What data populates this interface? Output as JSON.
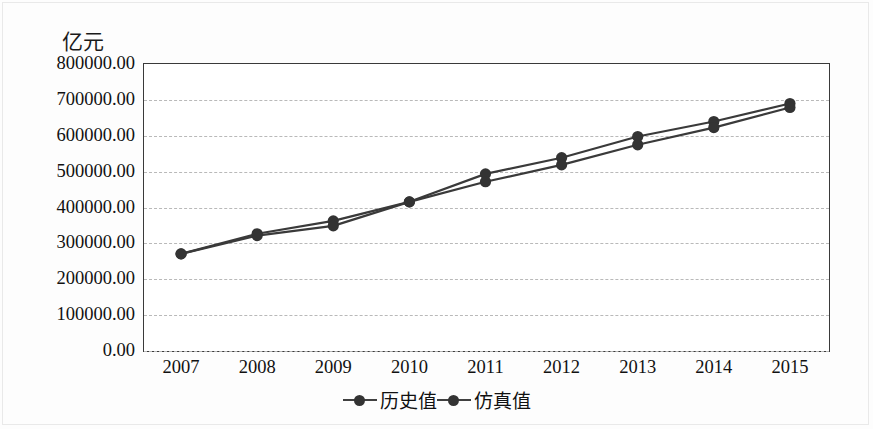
{
  "chart_data": {
    "type": "line",
    "title": "",
    "subtitle": "",
    "xlabel": "",
    "ylabel": "亿元",
    "yunit_label": "亿元",
    "categories": [
      "2007",
      "2008",
      "2009",
      "2010",
      "2011",
      "2012",
      "2013",
      "2014",
      "2015"
    ],
    "x": [
      2007,
      2008,
      2009,
      2010,
      2011,
      2012,
      2013,
      2014,
      2015
    ],
    "series": [
      {
        "name": "历史值",
        "color": "#3a3a3a",
        "marker": "circle",
        "values": [
          268000,
          324000,
          360000,
          413000,
          491000,
          536000,
          595000,
          637000,
          687000
        ]
      },
      {
        "name": "仿真值",
        "color": "#3a3a3a",
        "marker": "circle",
        "values": [
          268000,
          319000,
          346000,
          413000,
          469000,
          516000,
          572000,
          620000,
          676000
        ]
      }
    ],
    "ylim": [
      0,
      800000
    ],
    "ytick_values": [
      0,
      100000,
      200000,
      300000,
      400000,
      500000,
      600000,
      700000,
      800000
    ],
    "ytick_labels": [
      "0.00",
      "100000.00",
      "200000.00",
      "300000.00",
      "400000.00",
      "500000.00",
      "600000.00",
      "700000.00",
      "800000.00"
    ],
    "grid": true,
    "grid_style": "dashed-horizontal",
    "legend_position": "bottom-center",
    "legend": [
      "历史值",
      "仿真值"
    ]
  },
  "colors": {
    "line": "#3a3a3a",
    "marker": "#333333",
    "gridline": "#b9b9b9",
    "axis": "#3a3a3a",
    "text": "#111111",
    "background": "#ffffff"
  }
}
